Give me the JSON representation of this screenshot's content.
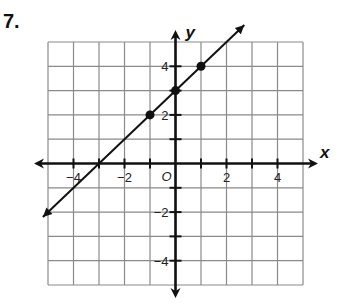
{
  "problem": {
    "number": "7."
  },
  "chart_data": {
    "type": "line",
    "title": "",
    "xlabel": "x",
    "ylabel": "y",
    "xlim": [
      -5,
      5
    ],
    "ylim": [
      -5,
      5
    ],
    "grid": true,
    "origin_label": "O",
    "x_tick_labels": [
      {
        "value": -4,
        "label": "−4"
      },
      {
        "value": -2,
        "label": "−2"
      },
      {
        "value": 2,
        "label": "2"
      },
      {
        "value": 4,
        "label": "4"
      }
    ],
    "y_tick_labels": [
      {
        "value": 4,
        "label": "4"
      },
      {
        "value": 2,
        "label": "2"
      },
      {
        "value": -2,
        "label": "−2"
      },
      {
        "value": -4,
        "label": "−4"
      }
    ],
    "line": {
      "slope": 1,
      "intercept": 3,
      "equation": "y = x + 3",
      "x_range": [
        -5.2,
        2.7
      ]
    },
    "points": [
      {
        "x": -1,
        "y": 2
      },
      {
        "x": 0,
        "y": 3
      },
      {
        "x": 1,
        "y": 4
      }
    ],
    "colors": {
      "grid": "#8a8a8a",
      "axes": "#111111",
      "line": "#111111"
    }
  }
}
